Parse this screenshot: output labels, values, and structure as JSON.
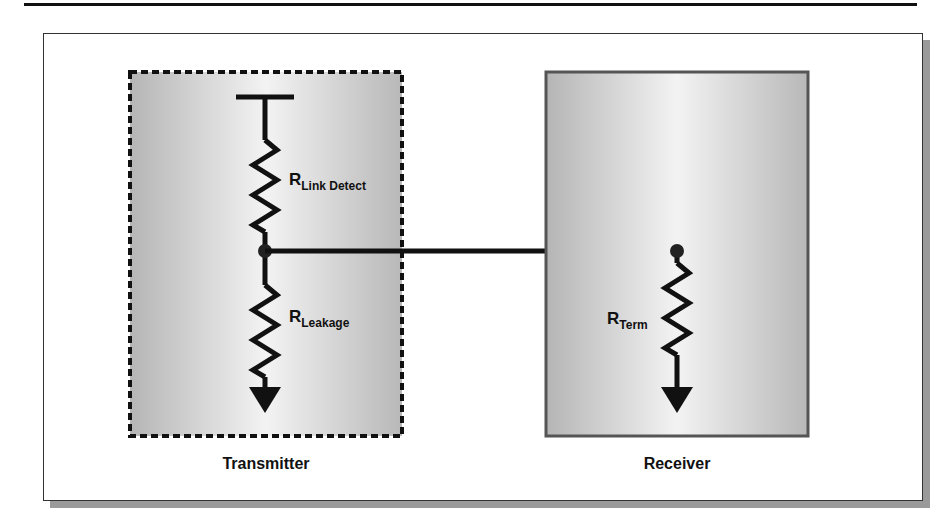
{
  "diagram": {
    "transmitter": {
      "label": "Transmitter",
      "border_style": "dashed",
      "resistors": [
        {
          "name": "R",
          "subscript": "Link Detect"
        },
        {
          "name": "R",
          "subscript": "Leakage"
        }
      ],
      "supply_symbol": "supply-bar",
      "ground_symbol": "ground-arrow"
    },
    "receiver": {
      "label": "Receiver",
      "border_style": "solid",
      "resistors": [
        {
          "name": "R",
          "subscript": "Term"
        }
      ],
      "ground_symbol": "ground-arrow"
    },
    "connection": "link-wire",
    "colors": {
      "line": "#111111",
      "panel_edge": "#b8b8b8",
      "panel_center": "#f2f2f2",
      "receiver_border": "#555555"
    }
  }
}
